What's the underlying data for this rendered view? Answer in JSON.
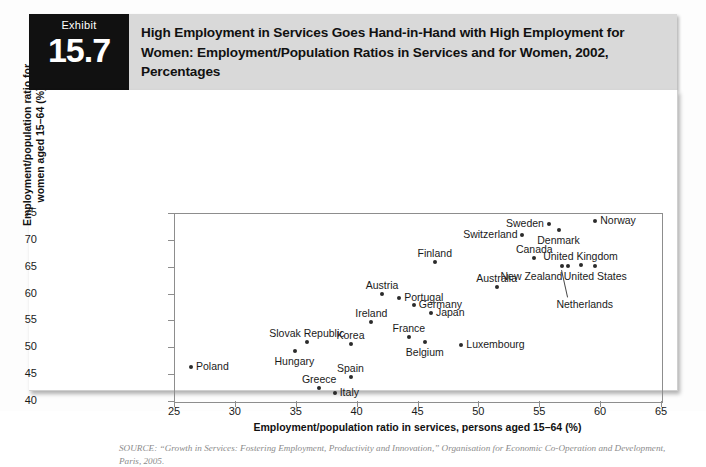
{
  "exhibit": {
    "word": "Exhibit",
    "number": "15.7",
    "title": "High Employment in Services Goes Hand-in-Hand with High Employment for Women: Employment/Population Ratios in Services and for Women, 2002, Percentages"
  },
  "source": "SOURCE: “Growth in Services: Fostering Employment, Productivity and Innovation,” Organisation for Economic Co-Operation and Development, Paris, 2005.",
  "chart_data": {
    "type": "scatter",
    "title": "High Employment in Services Goes Hand-in-Hand with High Employment for Women: Employment/Population Ratios in Services and for Women, 2002, Percentages",
    "xlabel": "Employment/population ratio in services, persons aged 15–64 (%)",
    "ylabel": "Employment/population ratio for women aged 15–64 (%)",
    "xlim": [
      25,
      65
    ],
    "ylim": [
      40,
      75
    ],
    "xticks": [
      25,
      30,
      35,
      40,
      45,
      50,
      55,
      60,
      65
    ],
    "yticks": [
      40,
      45,
      50,
      55,
      60,
      65,
      70,
      75
    ],
    "grid": false,
    "legend": false,
    "points": [
      {
        "name": "Poland",
        "x": 26.4,
        "y": 46.3,
        "label_pos": "right"
      },
      {
        "name": "Hungary",
        "x": 34.9,
        "y": 49.4,
        "label_pos": "below"
      },
      {
        "name": "Slovak Republic",
        "x": 35.9,
        "y": 50.9,
        "label_pos": "above"
      },
      {
        "name": "Greece",
        "x": 36.9,
        "y": 42.4,
        "label_pos": "above"
      },
      {
        "name": "Spain",
        "x": 39.5,
        "y": 44.4,
        "label_pos": "above"
      },
      {
        "name": "Italy",
        "x": 38.2,
        "y": 41.4,
        "label_pos": "right"
      },
      {
        "name": "Korea",
        "x": 39.5,
        "y": 50.6,
        "label_pos": "above"
      },
      {
        "name": "Ireland",
        "x": 41.2,
        "y": 54.8,
        "label_pos": "above"
      },
      {
        "name": "Austria",
        "x": 42.1,
        "y": 60.0,
        "label_pos": "above"
      },
      {
        "name": "Portugal",
        "x": 43.5,
        "y": 59.2,
        "label_pos": "right"
      },
      {
        "name": "Germany",
        "x": 44.7,
        "y": 57.8,
        "label_pos": "right"
      },
      {
        "name": "France",
        "x": 44.3,
        "y": 51.9,
        "label_pos": "above"
      },
      {
        "name": "Belgium",
        "x": 45.6,
        "y": 50.9,
        "label_pos": "below"
      },
      {
        "name": "Japan",
        "x": 46.1,
        "y": 56.3,
        "label_pos": "right"
      },
      {
        "name": "Finland",
        "x": 46.4,
        "y": 65.9,
        "label_pos": "above"
      },
      {
        "name": "Luxembourg",
        "x": 48.6,
        "y": 50.5,
        "label_pos": "right"
      },
      {
        "name": "Australia",
        "x": 51.5,
        "y": 61.3,
        "label_pos": "above"
      },
      {
        "name": "Switzerland",
        "x": 53.6,
        "y": 70.9,
        "label_pos": "left"
      },
      {
        "name": "Canada",
        "x": 54.6,
        "y": 66.6,
        "label_pos": "above"
      },
      {
        "name": "Sweden",
        "x": 55.8,
        "y": 72.9,
        "label_pos": "left"
      },
      {
        "name": "Denmark",
        "x": 56.6,
        "y": 71.9,
        "label_pos": "below"
      },
      {
        "name": "Netherlands",
        "x": 56.9,
        "y": 65.1,
        "label_pos": "leader"
      },
      {
        "name": "New Zealand",
        "x": 57.4,
        "y": 65.1,
        "label_pos": "belowleft"
      },
      {
        "name": "United Kingdom",
        "x": 58.4,
        "y": 65.3,
        "label_pos": "above"
      },
      {
        "name": "United States",
        "x": 59.6,
        "y": 65.1,
        "label_pos": "below"
      },
      {
        "name": "Norway",
        "x": 59.6,
        "y": 73.5,
        "label_pos": "right"
      }
    ]
  }
}
